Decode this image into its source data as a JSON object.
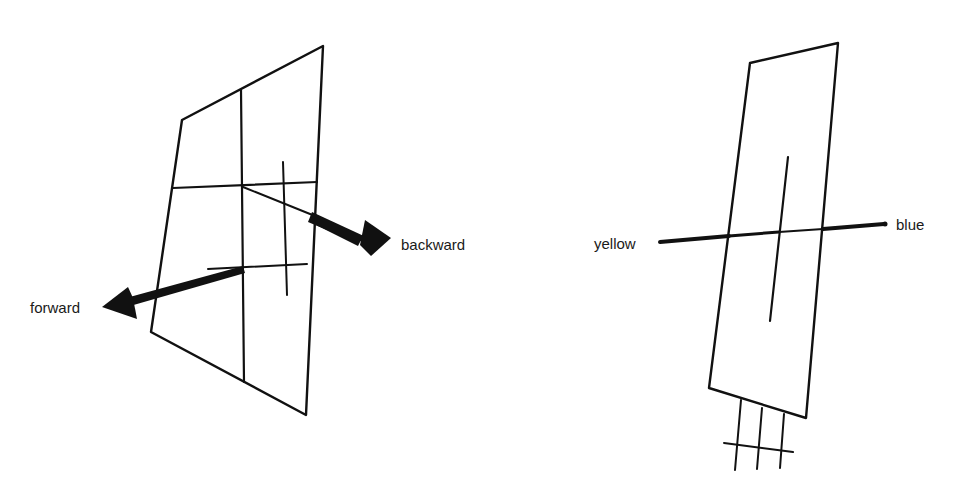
{
  "figure_left": {
    "description": "quadrilateral plane with grid lines and two arrows",
    "labels": {
      "forward": "forward",
      "backward": "backward"
    }
  },
  "figure_right": {
    "description": "narrow tilted plane with a crossing axis and grid below",
    "labels": {
      "yellow": "yellow",
      "blue": "blue"
    }
  },
  "colors": {
    "ink": "#111111",
    "background": "#ffffff"
  }
}
